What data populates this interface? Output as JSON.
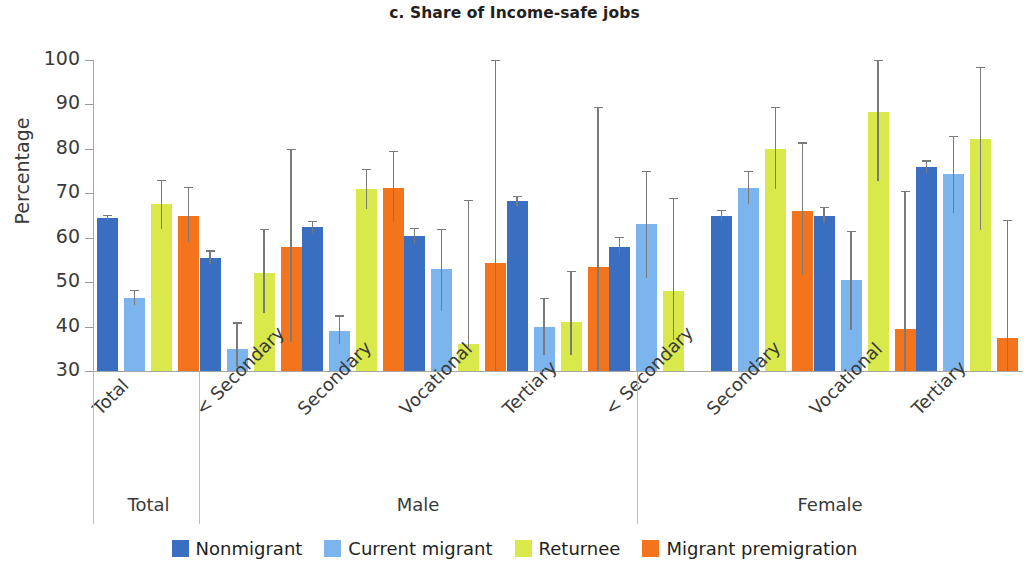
{
  "chart_data": {
    "type": "bar",
    "title": "c. Share of Income-safe jobs",
    "xlabel": "",
    "ylabel": "Percentage",
    "ylim": [
      30,
      100
    ],
    "yticks": [
      30,
      40,
      50,
      60,
      70,
      80,
      90,
      100
    ],
    "grid": false,
    "legend_position": "bottom",
    "orientation": "vertical",
    "error_bars": "95% confidence interval",
    "group_labels": [
      "Total",
      "Male",
      "Female"
    ],
    "groups": [
      {
        "group": "Total",
        "categories": [
          "Total"
        ]
      },
      {
        "group": "Male",
        "categories": [
          "< Secondary",
          "Secondary",
          "Vocational",
          "Tertiary"
        ]
      },
      {
        "group": "Female",
        "categories": [
          "< Secondary",
          "Secondary",
          "Vocational",
          "Tertiary"
        ]
      }
    ],
    "categories": [
      "Total",
      "< Secondary",
      "Secondary",
      "Vocational",
      "Tertiary",
      "< Secondary",
      "Secondary",
      "Vocational",
      "Tertiary"
    ],
    "series": [
      {
        "name": "Nonmigrant",
        "color": "#3a6ec0",
        "values": [
          64.5,
          55.5,
          62.3,
          60.3,
          68.3,
          58.0,
          65.0,
          65.0,
          76.0
        ],
        "err_low": [
          63.8,
          54.0,
          61.0,
          58.6,
          67.2,
          56.0,
          63.7,
          63.2,
          74.6
        ],
        "err_high": [
          65.1,
          57.2,
          63.8,
          62.2,
          69.5,
          60.2,
          66.3,
          66.9,
          77.4
        ]
      },
      {
        "name": "Current migrant",
        "color": "#7cb4ee",
        "values": [
          46.5,
          35.0,
          39.0,
          53.0,
          40.0,
          63.0,
          71.3,
          50.5,
          74.3
        ],
        "err_low": [
          44.8,
          31.0,
          36.0,
          43.5,
          33.5,
          51.0,
          67.5,
          39.3,
          65.5
        ],
        "err_high": [
          48.3,
          41.0,
          42.5,
          62.0,
          46.5,
          75.0,
          75.0,
          61.5,
          83.0
        ]
      },
      {
        "name": "Returnee",
        "color": "#d9e84a",
        "values": [
          67.5,
          52.0,
          71.0,
          36.0,
          41.0,
          48.0,
          80.0,
          88.3,
          82.3
        ],
        "err_low": [
          62.0,
          43.0,
          66.5,
          35.5,
          33.5,
          37.0,
          71.0,
          72.8,
          61.8
        ],
        "err_high": [
          73.0,
          62.0,
          75.5,
          68.5,
          52.5,
          69.0,
          89.5,
          104.5,
          98.5
        ]
      },
      {
        "name": "Migrant premigration",
        "color": "#f4741e",
        "values": [
          65.0,
          58.0,
          71.3,
          54.3,
          53.3,
          null,
          66.0,
          39.5,
          37.5
        ],
        "err_low": [
          59.0,
          36.5,
          63.5,
          30.0,
          30.0,
          null,
          51.5,
          30.0,
          30.0
        ],
        "err_high": [
          71.5,
          80.0,
          79.5,
          100.5,
          89.5,
          null,
          81.5,
          70.5,
          64.0
        ]
      }
    ],
    "legend": [
      {
        "label": "Nonmigrant",
        "color": "#3a6ec0"
      },
      {
        "label": "Current migrant",
        "color": "#7cb4ee"
      },
      {
        "label": "Returnee",
        "color": "#d9e84a"
      },
      {
        "label": "Migrant premigration",
        "color": "#f4741e"
      }
    ]
  }
}
